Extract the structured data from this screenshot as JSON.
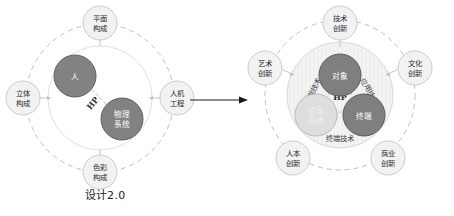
{
  "figure": {
    "background": "#ffffff",
    "ink": "#2b2b2b"
  },
  "colors": {
    "dark_circle": "#7f7f7f",
    "dark_circle_stroke": "#5a5a5a",
    "light_circle": "#dcdcdc",
    "light_circle_stroke": "#b5b5b5",
    "node_fill": "#f2f2f2",
    "node_stroke": "#c9c9c9",
    "dashed_ring": "#c0c0c0",
    "solid_ring": "#dddddd",
    "arrow": "#1a1a1a",
    "text": "#2b2b2b"
  },
  "left_panel": {
    "caption": "设计2.0",
    "center_nodes": [
      {
        "id": "human",
        "label": "人",
        "tone": "dark"
      },
      {
        "id": "physical-system",
        "label_line1": "物理",
        "label_line2": "系统",
        "tone": "dark"
      }
    ],
    "link_label": "HP",
    "outer_nodes": [
      {
        "id": "plane-composition",
        "line1": "平面",
        "line2": "构成",
        "position": "top"
      },
      {
        "id": "solid-composition",
        "line1": "立体",
        "line2": "构成",
        "position": "left"
      },
      {
        "id": "ergonomics",
        "line1": "人机",
        "line2": "工程",
        "position": "right"
      },
      {
        "id": "color-composition",
        "line1": "色彩",
        "line2": "构成",
        "position": "bottom"
      }
    ]
  },
  "transition": {
    "arrow_name": "right-arrow"
  },
  "right_panel": {
    "caption": "设计3.0",
    "center_nodes": [
      {
        "id": "object",
        "line1": "对象",
        "line2": "",
        "tone": "dark"
      },
      {
        "id": "info-system",
        "line1": "信息",
        "line2": "系统",
        "tone": "light"
      },
      {
        "id": "terminal",
        "line1": "终端",
        "line2": "",
        "tone": "dark"
      }
    ],
    "link_label": "HP",
    "spoke_labels": [
      {
        "id": "enabling-technology",
        "label": "创能技术",
        "side": "left"
      },
      {
        "id": "application-technology",
        "label": "应用技术",
        "side": "right"
      },
      {
        "id": "terminal-technology",
        "label": "终端技术",
        "side": "bottom"
      }
    ],
    "outer_nodes": [
      {
        "id": "technology-innovation",
        "line1": "技术",
        "line2": "创新",
        "position": "top"
      },
      {
        "id": "art-innovation",
        "line1": "艺术",
        "line2": "创新",
        "position": "upper-left"
      },
      {
        "id": "culture-innovation",
        "line1": "文化",
        "line2": "创新",
        "position": "upper-right"
      },
      {
        "id": "humanistic-innovation",
        "line1": "人本",
        "line2": "创新",
        "position": "lower-left"
      },
      {
        "id": "business-innovation",
        "line1": "商业",
        "line2": "创新",
        "position": "lower-right"
      }
    ]
  }
}
